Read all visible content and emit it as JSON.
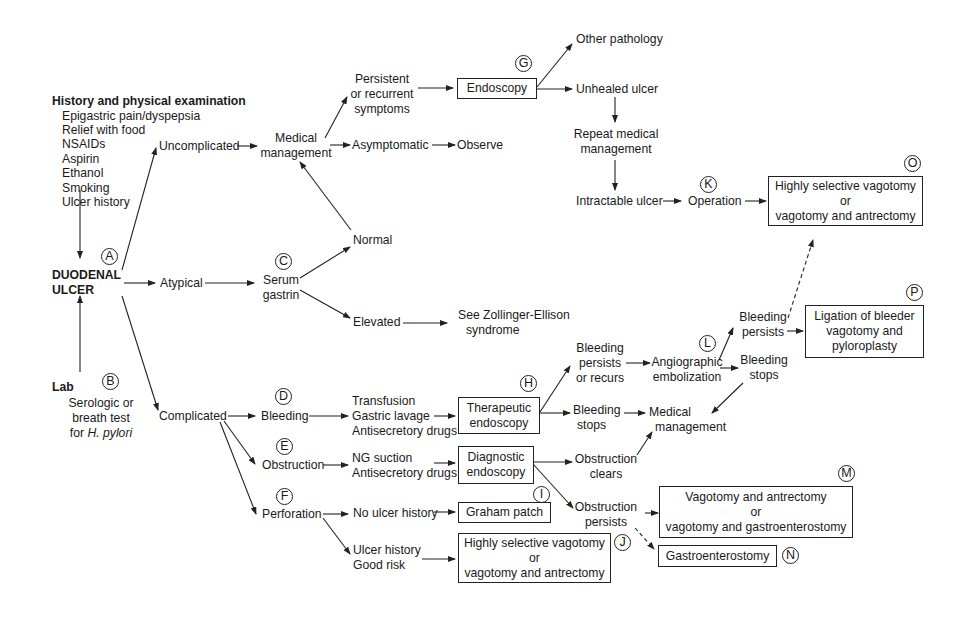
{
  "history": {
    "title": "History and physical examination",
    "items": [
      "Epigastric pain/dyspepsia",
      "Relief with food",
      "NSAIDs",
      "Aspirin",
      "Ethanol",
      "Smoking",
      "Ulcer history"
    ]
  },
  "root": {
    "line1": "DUODENAL",
    "line2": "ULCER",
    "label": "A"
  },
  "lab": {
    "title": "Lab",
    "label": "B",
    "line1": "Serologic or",
    "line2": "breath test",
    "line3_prefix": "for ",
    "line3_italic": "H. pylori"
  },
  "branches": {
    "uncomplicated": "Uncomplicated",
    "atypical": "Atypical",
    "complicated": "Complicated"
  },
  "medical_management": {
    "line1": "Medical",
    "line2": "management"
  },
  "persistent": {
    "line1": "Persistent",
    "line2": "or recurrent",
    "line3": "symptoms"
  },
  "asymptomatic": "Asymptomatic",
  "observe": "Observe",
  "endoscopy": {
    "text": "Endoscopy",
    "label": "G"
  },
  "other_pathology": "Other pathology",
  "unhealed_ulcer": "Unhealed ulcer",
  "repeat_medical": {
    "line1": "Repeat medical",
    "line2": "management"
  },
  "intractable_ulcer": "Intractable ulcer",
  "operation": {
    "text": "Operation",
    "label": "K"
  },
  "box_o": {
    "line1": "Highly selective vagotomy",
    "line2": "or",
    "line3": "vagotomy and antrectomy",
    "label": "O"
  },
  "serum_gastrin": {
    "line1": "Serum",
    "line2": "gastrin",
    "label": "C"
  },
  "normal": "Normal",
  "elevated": "Elevated",
  "zollinger": {
    "line1": "See Zollinger-Ellison",
    "line2": "syndrome"
  },
  "bleeding": {
    "text": "Bleeding",
    "label": "D"
  },
  "bleeding_tx": [
    "Transfusion",
    "Gastric lavage",
    "Antisecretory drugs"
  ],
  "therapeutic_endoscopy": {
    "line1": "Therapeutic",
    "line2": "endoscopy",
    "label": "H"
  },
  "bleeding_persists_recurs": {
    "line1": "Bleeding",
    "line2": "persists",
    "line3": "or recurs"
  },
  "bleeding_stops_1": {
    "line1": "Bleeding",
    "line2": "stops"
  },
  "angiographic": {
    "line1": "Angiographic",
    "line2": "embolization",
    "label": "L"
  },
  "bleeding_persists_2": {
    "line1": "Bleeding",
    "line2": "persists"
  },
  "bleeding_stops_2": {
    "line1": "Bleeding",
    "line2": "stops"
  },
  "box_p": {
    "line1": "Ligation of bleeder",
    "line2": "vagotomy and",
    "line3": "pyloroplasty",
    "label": "P"
  },
  "medical_management_2": {
    "line1": "Medical",
    "line2": "management"
  },
  "obstruction": {
    "text": "Obstruction",
    "label": "E"
  },
  "obstruction_tx": [
    "NG suction",
    "Antisecretory drugs"
  ],
  "diagnostic_endoscopy": {
    "line1": "Diagnostic",
    "line2": "endoscopy",
    "label": "I"
  },
  "obstruction_clears": {
    "line1": "Obstruction",
    "line2": "clears"
  },
  "obstruction_persists": {
    "line1": "Obstruction",
    "line2": "persists"
  },
  "box_m": {
    "line1": "Vagotomy and antrectomy",
    "line2": "or",
    "line3": "vagotomy and gastroenterostomy",
    "label": "M"
  },
  "box_n": {
    "text": "Gastroenterostomy",
    "label": "N"
  },
  "perforation": {
    "text": "Perforation",
    "label": "F"
  },
  "no_ulcer_history": "No ulcer history",
  "graham_patch": "Graham patch",
  "ulcer_history_good_risk": {
    "line1": "Ulcer history",
    "line2": "Good risk"
  },
  "box_j": {
    "line1": "Highly selective vagotomy",
    "line2": "or",
    "line3": "vagotomy and antrectomy",
    "label": "J"
  }
}
